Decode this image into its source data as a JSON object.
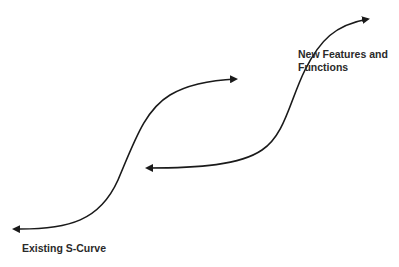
{
  "diagram": {
    "type": "s-curve-diagram",
    "stroke_color": "#1a1a1a",
    "labels": {
      "existing_curve": "Existing S-Curve",
      "new_curve_line1": "New Features and",
      "new_curve_line2": "Functions"
    },
    "curves": [
      {
        "name": "existing-s-curve",
        "path": "M 14 229 C 70 230, 100 220, 118 180 C 135 140, 145 110, 170 95 C 190 83, 215 80, 236 79",
        "arrows": "both"
      },
      {
        "name": "new-features-s-curve",
        "path": "M 147 168 C 200 168, 240 165, 262 150 C 285 135, 290 100, 305 70 C 320 40, 335 25, 368 19",
        "arrows": "both"
      }
    ]
  }
}
